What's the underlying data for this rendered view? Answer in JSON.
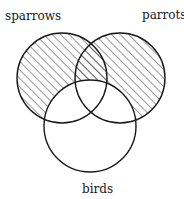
{
  "diagram": {
    "type": "venn",
    "sets": [
      {
        "id": "sparrows",
        "label": "sparrows",
        "cx": 62,
        "cy": 78,
        "r": 45,
        "shaded": true
      },
      {
        "id": "parrots",
        "label": "parrots",
        "cx": 120,
        "cy": 78,
        "r": 45,
        "shaded": true
      },
      {
        "id": "birds",
        "label": "birds",
        "cx": 90,
        "cy": 126,
        "r": 46,
        "shaded": false
      }
    ],
    "shading": "diagonal-hatch",
    "shaded_regions": "sparrows and parrots outside of birds",
    "stroke_color": "#1a1a1a",
    "hatch_color": "#333333",
    "background": "#ffffff"
  },
  "labels": {
    "sparrows": "sparrows",
    "parrots": "parrots",
    "birds": "birds"
  }
}
